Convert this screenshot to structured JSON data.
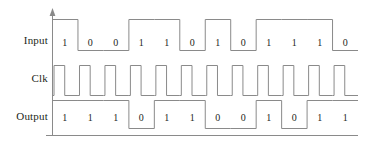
{
  "figure": {
    "type": "timing-diagram",
    "rows": [
      {
        "key": "input",
        "label": "Input"
      },
      {
        "key": "clk",
        "label": "Clk"
      },
      {
        "key": "output",
        "label": "Output"
      }
    ],
    "bit_count": 12,
    "colors": {
      "line": "#8a8a8a",
      "axis": "#8a8a8a",
      "text": "#231f20",
      "background": "#ffffff"
    }
  },
  "signals": {
    "input": {
      "label": "Input",
      "bits": [
        "1",
        "0",
        "0",
        "1",
        "1",
        "0",
        "1",
        "0",
        "1",
        "1",
        "1",
        "0"
      ],
      "levels": [
        1,
        0,
        0,
        1,
        1,
        0,
        1,
        0,
        1,
        1,
        1,
        0
      ]
    },
    "clk": {
      "label": "Clk",
      "pulses": 12
    },
    "output": {
      "label": "Output",
      "bits": [
        "1",
        "1",
        "1",
        "0",
        "1",
        "1",
        "0",
        "0",
        "1",
        "0",
        "1",
        "1"
      ],
      "levels": [
        1,
        1,
        1,
        0,
        1,
        1,
        0,
        0,
        1,
        0,
        1,
        1
      ]
    }
  },
  "axis": {
    "vertical_arrow": "up-arrow",
    "baseline": "horizontal-baseline"
  }
}
